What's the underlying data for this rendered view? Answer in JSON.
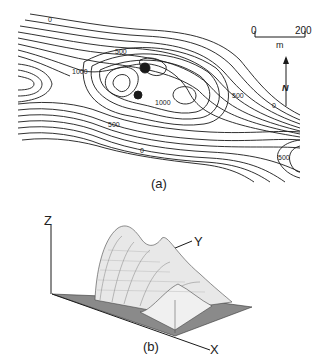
{
  "figure_a": {
    "caption": "(a)",
    "contour_labels": [
      "0",
      "500",
      "1000",
      "1000",
      "500",
      "0",
      "500",
      "0",
      "500"
    ],
    "scale_bar": {
      "start": "0",
      "end": "200",
      "unit": "m"
    },
    "north_arrow": "N"
  },
  "figure_b": {
    "caption": "(b)",
    "axes": {
      "z": "Z",
      "y": "Y",
      "x": "X"
    }
  },
  "colors": {
    "ink": "#1a1a1a",
    "paper": "#ffffff",
    "base_plane": "#8a8a8a"
  }
}
